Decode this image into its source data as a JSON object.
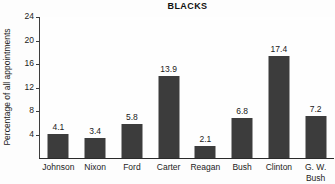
{
  "chart_data": {
    "type": "bar",
    "title": "BLACKS",
    "xlabel": "",
    "ylabel": "Percentage of all appointments",
    "categories": [
      "Johnson",
      "Nixon",
      "Ford",
      "Carter",
      "Reagan",
      "Bush",
      "Clinton",
      "G. W. Bush"
    ],
    "category_lines": [
      [
        "Johnson"
      ],
      [
        "Nixon"
      ],
      [
        "Ford"
      ],
      [
        "Carter"
      ],
      [
        "Reagan"
      ],
      [
        "Bush"
      ],
      [
        "Clinton"
      ],
      [
        "G. W.",
        "Bush"
      ]
    ],
    "values": [
      4.1,
      3.4,
      5.8,
      13.9,
      2.1,
      6.8,
      17.4,
      7.2
    ],
    "value_labels": [
      "4.1",
      "3.4",
      "5.8",
      "13.9",
      "2.1",
      "6.8",
      "17.4",
      "7.2"
    ],
    "ylim": [
      0,
      24
    ],
    "yticks": [
      4,
      8,
      12,
      16,
      20,
      24
    ],
    "ytick_labels": [
      "4",
      "8",
      "12",
      "16",
      "20",
      "24"
    ],
    "grid": false,
    "legend": false,
    "bar_color": "#3c3c3c",
    "background_color": "#fdfdfd",
    "axis_color": "#2a2a2a",
    "text_color": "#1a1a1a"
  }
}
